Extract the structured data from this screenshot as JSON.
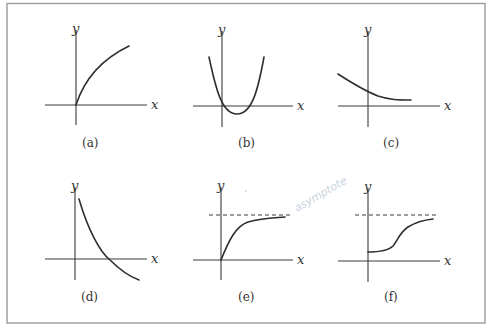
{
  "figure": {
    "panels": [
      {
        "id": "a",
        "label": "(a)",
        "x_axis_label": "x",
        "y_axis_label": "y",
        "shape": "concave increasing from origin"
      },
      {
        "id": "b",
        "label": "(b)",
        "x_axis_label": "x",
        "y_axis_label": "y",
        "shape": "upward parabola with minimum below x-axis"
      },
      {
        "id": "c",
        "label": "(c)",
        "x_axis_label": "x",
        "y_axis_label": "y",
        "shape": "decreasing curve leveling off above x-axis"
      },
      {
        "id": "d",
        "label": "(d)",
        "x_axis_label": "x",
        "y_axis_label": "y",
        "shape": "decreasing convex curve crossing x-axis"
      },
      {
        "id": "e",
        "label": "(e)",
        "x_axis_label": "x",
        "y_axis_label": "y",
        "shape": "increasing from origin approaching dashed horizontal asymptote"
      },
      {
        "id": "f",
        "label": "(f)",
        "x_axis_label": "x",
        "y_axis_label": "y",
        "shape": "S-shaped increasing curve approaching dashed horizontal asymptote"
      }
    ],
    "handwritten_note": "asymptote"
  }
}
